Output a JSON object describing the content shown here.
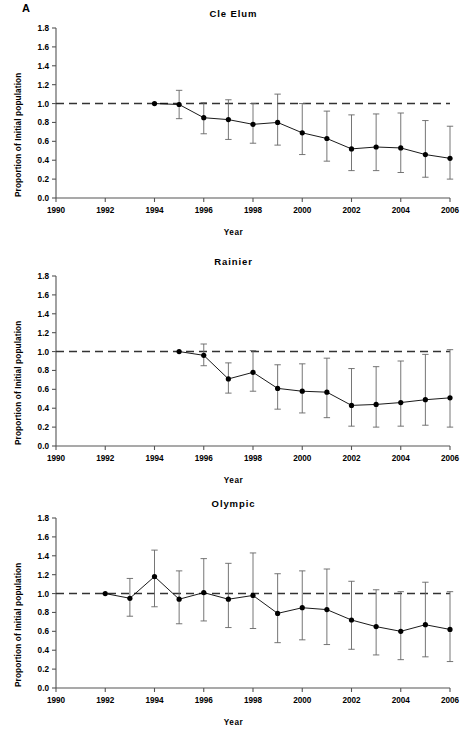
{
  "figure": {
    "panel_label": "A",
    "axis_color": "#555555",
    "series_color": "#000000",
    "reference_line_color": "#333333",
    "errorbar_color": "#666666",
    "background": "#ffffff"
  },
  "axes": {
    "xlabel": "Year",
    "ylabel": "Proportion of Initial population",
    "xticks": [
      "1990",
      "1992",
      "1994",
      "1996",
      "1998",
      "2000",
      "2002",
      "2004",
      "2006"
    ],
    "xtick_values": [
      1990,
      1992,
      1994,
      1996,
      1998,
      2000,
      2002,
      2004,
      2006
    ],
    "yticks": [
      "0.0",
      "0.2",
      "0.4",
      "0.6",
      "0.8",
      "1.0",
      "1.2",
      "1.4",
      "1.6",
      "1.8"
    ],
    "ytick_values": [
      0.0,
      0.2,
      0.4,
      0.6,
      0.8,
      1.0,
      1.2,
      1.4,
      1.6,
      1.8
    ],
    "xlim": [
      1990,
      2006
    ],
    "ylim": [
      0.0,
      1.8
    ],
    "grid": false,
    "reference_line_y": 1.0
  },
  "chart_data": [
    {
      "type": "line",
      "title": "Cle Elum",
      "xlabel": "Year",
      "ylabel": "Proportion of Initial population",
      "xlim": [
        1990,
        2006
      ],
      "ylim": [
        0.0,
        1.8
      ],
      "grid": false,
      "legend": "none",
      "reference_line": {
        "y": 1.0,
        "style": "dashed"
      },
      "x": [
        1994,
        1995,
        1996,
        1997,
        1998,
        1999,
        2000,
        2001,
        2002,
        2003,
        2004,
        2005,
        2006
      ],
      "values": [
        1.0,
        0.99,
        0.85,
        0.83,
        0.78,
        0.8,
        0.69,
        0.63,
        0.52,
        0.54,
        0.53,
        0.46,
        0.42
      ],
      "err_low": [
        1.0,
        0.84,
        0.68,
        0.62,
        0.58,
        0.56,
        0.46,
        0.39,
        0.29,
        0.29,
        0.27,
        0.22,
        0.2
      ],
      "err_high": [
        1.0,
        1.14,
        1.01,
        1.04,
        1.0,
        1.1,
        1.0,
        0.92,
        0.88,
        0.89,
        0.9,
        0.82,
        0.76
      ]
    },
    {
      "type": "line",
      "title": "Rainier",
      "xlabel": "Year",
      "ylabel": "Proportion of Initial population",
      "xlim": [
        1990,
        2006
      ],
      "ylim": [
        0.0,
        1.8
      ],
      "grid": false,
      "legend": "none",
      "reference_line": {
        "y": 1.0,
        "style": "dashed"
      },
      "x": [
        1995,
        1996,
        1997,
        1998,
        1999,
        2000,
        2001,
        2002,
        2003,
        2004,
        2005,
        2006
      ],
      "values": [
        1.0,
        0.96,
        0.71,
        0.78,
        0.61,
        0.58,
        0.57,
        0.43,
        0.44,
        0.46,
        0.49,
        0.51
      ],
      "err_low": [
        1.0,
        0.85,
        0.56,
        0.58,
        0.39,
        0.35,
        0.3,
        0.21,
        0.2,
        0.21,
        0.22,
        0.2
      ],
      "err_high": [
        1.0,
        1.08,
        0.88,
        1.01,
        0.86,
        0.87,
        0.93,
        0.82,
        0.84,
        0.9,
        0.97,
        1.02
      ]
    },
    {
      "type": "line",
      "title": "Olympic",
      "xlabel": "Year",
      "ylabel": "Proportion of Initial population",
      "xlim": [
        1990,
        2006
      ],
      "ylim": [
        0.0,
        1.8
      ],
      "grid": false,
      "legend": "none",
      "reference_line": {
        "y": 1.0,
        "style": "dashed"
      },
      "x": [
        1992,
        1993,
        1994,
        1995,
        1996,
        1997,
        1998,
        1999,
        2000,
        2001,
        2002,
        2003,
        2004,
        2005,
        2006
      ],
      "values": [
        1.0,
        0.95,
        1.18,
        0.94,
        1.01,
        0.94,
        0.98,
        0.79,
        0.85,
        0.83,
        0.72,
        0.65,
        0.6,
        0.67,
        0.62
      ],
      "err_low": [
        1.0,
        0.76,
        0.86,
        0.68,
        0.71,
        0.64,
        0.63,
        0.48,
        0.51,
        0.46,
        0.41,
        0.35,
        0.3,
        0.33,
        0.28
      ],
      "err_high": [
        1.0,
        1.16,
        1.46,
        1.24,
        1.37,
        1.32,
        1.43,
        1.21,
        1.24,
        1.26,
        1.13,
        1.04,
        1.02,
        1.12,
        1.02
      ]
    }
  ]
}
